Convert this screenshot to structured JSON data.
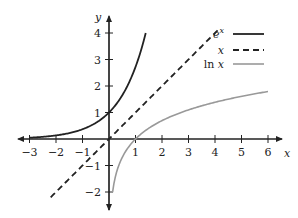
{
  "chart_data": {
    "type": "line",
    "title": "",
    "xlabel": "x",
    "ylabel": "y",
    "xlim": [
      -3,
      6
    ],
    "ylim": [
      -2,
      4
    ],
    "grid": false,
    "legend_position": "top-right",
    "x_ticks": [
      -3,
      -2,
      -1,
      1,
      2,
      3,
      4,
      5,
      6
    ],
    "x_tick_labels": [
      "−3",
      "−2",
      "−1",
      "1",
      "2",
      "3",
      "4",
      "5",
      "6"
    ],
    "y_ticks": [
      -2,
      -1,
      1,
      2,
      3,
      4
    ],
    "y_tick_labels": [
      "−2",
      "−1",
      "1",
      "2",
      "3",
      "4"
    ],
    "series": [
      {
        "name": "e^x",
        "label_main": "e",
        "label_sup": "x",
        "function": "exp",
        "x_range": [
          -3,
          1.386
        ],
        "style": "solid",
        "color": "#222222",
        "width": 1.8,
        "points": [
          [
            -3,
            0.05
          ],
          [
            -2,
            0.14
          ],
          [
            -1,
            0.37
          ],
          [
            0,
            1
          ],
          [
            0.5,
            1.65
          ],
          [
            1,
            2.72
          ],
          [
            1.386,
            4
          ]
        ]
      },
      {
        "name": "x",
        "label_main": "x",
        "function": "identity",
        "x_range": [
          -2.2,
          4.2
        ],
        "style": "dashed",
        "color": "#222222",
        "width": 1.8,
        "points": [
          [
            -2.2,
            -2.2
          ],
          [
            0,
            0
          ],
          [
            4.2,
            4.2
          ]
        ]
      },
      {
        "name": "ln x",
        "label_main": "ln x",
        "function": "log",
        "x_range": [
          0.135,
          6
        ],
        "style": "solid",
        "color": "#999999",
        "width": 1.6,
        "points": [
          [
            0.135,
            -2
          ],
          [
            0.5,
            -0.69
          ],
          [
            1,
            0
          ],
          [
            2,
            0.69
          ],
          [
            3,
            1.1
          ],
          [
            4,
            1.39
          ],
          [
            5,
            1.61
          ],
          [
            6,
            1.79
          ]
        ]
      }
    ]
  },
  "layout": {
    "origin_px": [
      109,
      139
    ],
    "unit_px": 26.5,
    "xaxis_px": [
      18,
      282
    ],
    "yaxis_px": [
      16,
      210
    ]
  }
}
